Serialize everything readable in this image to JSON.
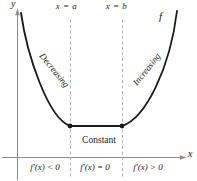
{
  "figure": {
    "title_hint": "Increasing, decreasing, and constant behavior of a function f",
    "y_axis_label": "y",
    "x_axis_label": "x",
    "vline_a_label": "x = a",
    "vline_b_label": "x = b",
    "function_label": "f",
    "region_decreasing_label": "Decreasing",
    "region_increasing_label": "Increasing",
    "region_constant_label": "Constant",
    "interval_left_label": "f′(x) < 0",
    "interval_middle_label": "f′(x) = 0",
    "interval_right_label": "f′(x) > 0"
  },
  "colors": {
    "curve": "#1a1a1a",
    "axis": "#8c8c8c",
    "dashed": "#b3b3b3",
    "text": "#1a1a1a",
    "background": "#ffffff"
  }
}
